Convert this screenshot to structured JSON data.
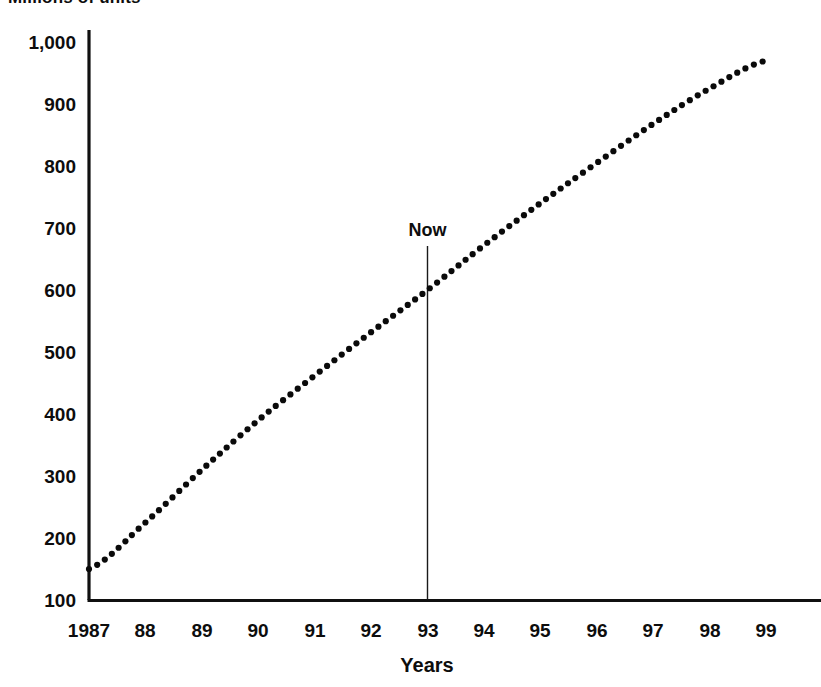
{
  "chart_title": "Millions of units",
  "annotations": [
    {
      "name": "now-marker",
      "label": "Now",
      "x_year": 93
    }
  ],
  "axis": {
    "x_title": "Years",
    "y_title": ""
  },
  "chart_data": {
    "type": "scatter",
    "title": "Millions of units",
    "subtitle": "",
    "xlabel": "Years",
    "ylabel": "",
    "grid": false,
    "legend": "none",
    "marker": "round-dot",
    "color": "#0a0a0a",
    "xlim": [
      1987,
      1999
    ],
    "ylim": [
      100,
      1000
    ],
    "ytick_labels": [
      "100",
      "200",
      "300",
      "400",
      "500",
      "600",
      "700",
      "800",
      "900",
      "1,000"
    ],
    "ytick_values": [
      100,
      200,
      300,
      400,
      500,
      600,
      700,
      800,
      900,
      1000
    ],
    "xtick_labels": [
      "1987",
      "88",
      "89",
      "90",
      "91",
      "92",
      "93",
      "94",
      "95",
      "96",
      "97",
      "98",
      "99"
    ],
    "xtick_values": [
      1987,
      1988,
      1989,
      1990,
      1991,
      1992,
      1993,
      1994,
      1995,
      1996,
      1997,
      1998,
      1999
    ],
    "categories": [
      1987,
      1988,
      1989,
      1990,
      1991,
      1992,
      1993,
      1994,
      1995,
      1996,
      1997,
      1998,
      1999
    ],
    "values": [
      150,
      225,
      310,
      390,
      462,
      532,
      600,
      672,
      740,
      805,
      868,
      925,
      970
    ],
    "annotations": [
      {
        "text": "Now",
        "x": 1993,
        "y": 600,
        "type": "vertical-line-with-label"
      }
    ]
  }
}
